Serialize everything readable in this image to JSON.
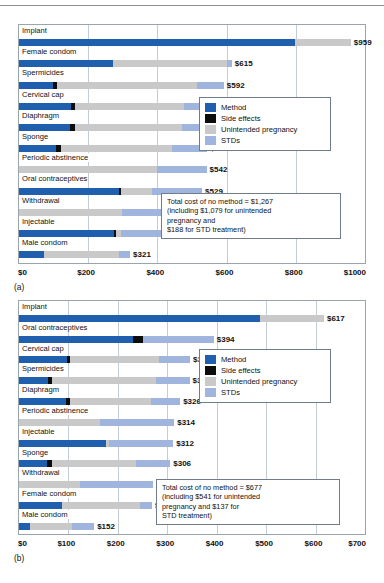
{
  "figures": [
    {
      "id": "a",
      "caption": "(a)",
      "legend": {
        "items": [
          {
            "label": "Method",
            "color": "#1f5fad",
            "key": "method"
          },
          {
            "label": "Side effects",
            "color": "#0d0d0d",
            "key": "side"
          },
          {
            "label": "Unintended pregnancy",
            "color": "#c9c9c9",
            "key": "pregnancy"
          },
          {
            "label": "STDs",
            "color": "#9fb5dd",
            "key": "stds"
          }
        ]
      },
      "note": {
        "lines": [
          "Total cost of no method = $1,267",
          "(including $1,079 for unintended",
          "pregnancy and",
          "$188 for STD treatment)"
        ]
      },
      "chart_data": {
        "type": "bar",
        "orientation": "horizontal",
        "stacked": true,
        "title": "",
        "xlabel": "",
        "ylabel": "",
        "xlim": [
          0,
          1000
        ],
        "grid": true,
        "legend_position": "right-middle",
        "ticks": [
          "$0",
          "$200",
          "$400",
          "$600",
          "$800",
          "$1000"
        ],
        "tickvalues": [
          0,
          200,
          400,
          600,
          800,
          1000
        ],
        "series": [
          {
            "name": "Method",
            "color": "#1f5fad"
          },
          {
            "name": "Side effects",
            "color": "#0d0d0d"
          },
          {
            "name": "Unintended pregnancy",
            "color": "#c9c9c9"
          },
          {
            "name": "STDs",
            "color": "#9fb5dd"
          }
        ],
        "categories": [
          "Implant",
          "Female condom",
          "Spermicides",
          "Cervical cap",
          "Diaphragm",
          "Sponge",
          "Periodic abstinence",
          "Oral contraceptives",
          "Withdrawal",
          "Injectable",
          "Male condom"
        ],
        "rows": [
          {
            "label": "Implant",
            "total": 959,
            "total_label": "$959",
            "method": 797,
            "side": 0,
            "pregnancy": 162,
            "stds": 0
          },
          {
            "label": "Female condom",
            "total": 615,
            "total_label": "$615",
            "method": 271,
            "side": 0,
            "pregnancy": 330,
            "stds": 14
          },
          {
            "label": "Spermicides",
            "total": 592,
            "total_label": "$592",
            "method": 97,
            "side": 12,
            "pregnancy": 406,
            "stds": 77
          },
          {
            "label": "Cervical cap",
            "total": 591,
            "total_label": "$591",
            "method": 150,
            "side": 13,
            "pregnancy": 315,
            "stds": 113
          },
          {
            "label": "Diaphragm",
            "total": 548,
            "total_label": "$548",
            "method": 148,
            "side": 13,
            "pregnancy": 310,
            "stds": 77
          },
          {
            "label": "Sponge",
            "total": 544,
            "total_label": "$544",
            "method": 108,
            "side": 12,
            "pregnancy": 321,
            "stds": 103
          },
          {
            "label": "Periodic abstinence",
            "total": 542,
            "total_label": "$542",
            "method": 0,
            "side": 0,
            "pregnancy": 398,
            "stds": 144
          },
          {
            "label": "Oral contraceptives",
            "total": 529,
            "total_label": "$529",
            "method": 289,
            "side": 5,
            "pregnancy": 90,
            "stds": 145
          },
          {
            "label": "Withdrawal",
            "total": 457,
            "total_label": "$457",
            "method": 0,
            "side": 0,
            "pregnancy": 299,
            "stds": 158
          },
          {
            "label": "Injectable",
            "total": 436,
            "total_label": "$436",
            "method": 274,
            "side": 5,
            "pregnancy": 17,
            "stds": 140
          },
          {
            "label": "Male condom",
            "total": 321,
            "total_label": "$321",
            "method": 72,
            "side": 0,
            "pregnancy": 217,
            "stds": 32
          }
        ]
      }
    },
    {
      "id": "b",
      "caption": "(b)",
      "legend": {
        "items": [
          {
            "label": "Method",
            "color": "#1f5fad",
            "key": "method"
          },
          {
            "label": "Side effects",
            "color": "#0d0d0d",
            "key": "side"
          },
          {
            "label": "Unintended pregnancy",
            "color": "#c9c9c9",
            "key": "pregnancy"
          },
          {
            "label": "STDs",
            "color": "#9fb5dd",
            "key": "stds"
          }
        ]
      },
      "note": {
        "lines": [
          "Total cost of no method = $677",
          "(including $541 for unintended",
          "pregnancy and $137 for",
          "STD treatment)"
        ]
      },
      "chart_data": {
        "type": "bar",
        "orientation": "horizontal",
        "stacked": true,
        "title": "",
        "xlabel": "",
        "ylabel": "",
        "xlim": [
          0,
          700
        ],
        "grid": true,
        "legend_position": "right-middle",
        "ticks": [
          "$0",
          "$100",
          "$200",
          "$300",
          "$400",
          "$500",
          "$600",
          "$700"
        ],
        "tickvalues": [
          0,
          100,
          200,
          300,
          400,
          500,
          600,
          700
        ],
        "series": [
          {
            "name": "Method",
            "color": "#1f5fad"
          },
          {
            "name": "Side effects",
            "color": "#0d0d0d"
          },
          {
            "name": "Unintended pregnancy",
            "color": "#c9c9c9"
          },
          {
            "name": "STDs",
            "color": "#9fb5dd"
          }
        ],
        "categories": [
          "Implant",
          "Oral contraceptives",
          "Cervical cap",
          "Spermicides",
          "Diaphragm",
          "Periodic abstinence",
          "Injectable",
          "Sponge",
          "Withdrawal",
          "Female condom",
          "Male condom"
        ],
        "rows": [
          {
            "label": "Implant",
            "total": 617,
            "total_label": "$617",
            "method": 487,
            "side": 0,
            "pregnancy": 130,
            "stds": 0
          },
          {
            "label": "Oral contraceptives",
            "total": 394,
            "total_label": "$394",
            "method": 231,
            "side": 20,
            "pregnancy": 0,
            "stds": 143
          },
          {
            "label": "Cervical cap",
            "total": 346,
            "total_label": "$346",
            "method": 97,
            "side": 7,
            "pregnancy": 180,
            "stds": 62
          },
          {
            "label": "Spermicides",
            "total": 345,
            "total_label": "$345",
            "method": 58,
            "side": 9,
            "pregnancy": 211,
            "stds": 67
          },
          {
            "label": "Diaphragm",
            "total": 326,
            "total_label": "$326",
            "method": 95,
            "side": 8,
            "pregnancy": 165,
            "stds": 58
          },
          {
            "label": "Periodic abstinence",
            "total": 314,
            "total_label": "$314",
            "method": 0,
            "side": 0,
            "pregnancy": 163,
            "stds": 151
          },
          {
            "label": "Injectable",
            "total": 312,
            "total_label": "$312",
            "method": 177,
            "side": 0,
            "pregnancy": 5,
            "stds": 130
          },
          {
            "label": "Sponge",
            "total": 306,
            "total_label": "$306",
            "method": 57,
            "side": 9,
            "pregnancy": 171,
            "stds": 69
          },
          {
            "label": "Withdrawal",
            "total": 272,
            "total_label": "$272",
            "method": 0,
            "side": 0,
            "pregnancy": 123,
            "stds": 149
          },
          {
            "label": "Female condom",
            "total": 269,
            "total_label": "$269",
            "method": 88,
            "side": 0,
            "pregnancy": 156,
            "stds": 25
          },
          {
            "label": "Male condom",
            "total": 152,
            "total_label": "$152",
            "method": 23,
            "side": 0,
            "pregnancy": 84,
            "stds": 45
          }
        ]
      }
    }
  ]
}
